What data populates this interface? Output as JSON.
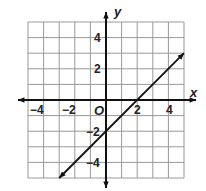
{
  "chart_data": {
    "type": "line",
    "title": "",
    "xlabel": "x",
    "ylabel": "y",
    "origin_label": "O",
    "xlim": [
      -5,
      5
    ],
    "ylim": [
      -5,
      5
    ],
    "grid": true,
    "x_ticks": [
      -4,
      -2,
      2,
      4
    ],
    "y_ticks": [
      4,
      2,
      -2,
      -4
    ],
    "x_tick_labels": [
      "−4",
      "−2",
      "2",
      "4"
    ],
    "y_tick_labels": [
      "4",
      "2",
      "−2",
      "−4"
    ],
    "series": [
      {
        "name": "line",
        "equation": "y = x - 2",
        "x": [
          -3,
          5
        ],
        "y": [
          -5,
          3
        ],
        "arrows": "both"
      }
    ]
  }
}
